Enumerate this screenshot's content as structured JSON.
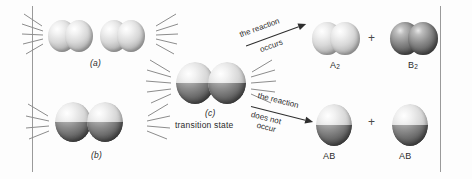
{
  "figure": {
    "background_color": "#fdfdfd",
    "rule_color": "#9a9a9a"
  },
  "panels": [
    {
      "id": "a",
      "label": "(a)",
      "caption": "",
      "description": "two A2 molecules approaching, horizontal diatomics"
    },
    {
      "id": "b",
      "label": "(b)",
      "caption": "",
      "description": "two vertically split spheres in contact"
    },
    {
      "id": "c",
      "label": "(c)",
      "caption": "transition state",
      "description": "four-atom square cluster"
    }
  ],
  "branches": [
    {
      "id": "upper",
      "line1": "the reaction",
      "line2": "occurs"
    },
    {
      "id": "lower",
      "line1": "the reaction",
      "line2": "does not",
      "line3": "occur"
    }
  ],
  "products": {
    "upper": {
      "left_label": "A",
      "left_sub": "2",
      "operator": "+",
      "right_label": "B",
      "right_sub": "2"
    },
    "lower": {
      "left_label": "AB",
      "operator": "+",
      "right_label": "AB"
    }
  },
  "colors": {
    "atom_light": "#d8d8d8",
    "atom_dark": "#5f5f5f",
    "text": "#2b2b2b",
    "ray": "#8c8c8c"
  }
}
